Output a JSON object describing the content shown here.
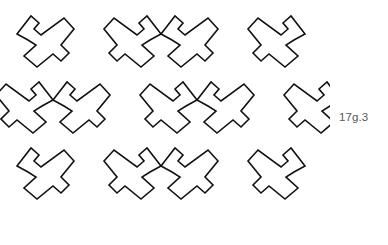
{
  "figure": {
    "label": "17g.3",
    "label_color": "#58595b",
    "background_color": "#ffffff",
    "stroke_color": "#111111",
    "stroke_width": 1.6,
    "width": 388,
    "height": 245
  },
  "chart_data": {
    "type": "diagram",
    "title": "17g.3",
    "subtype": "geometric tessellation / tiling pattern",
    "rows": 3,
    "tiles_per_row": 4,
    "total_tiles": 12,
    "unit_cell": {
      "width": 72,
      "height": 68
    },
    "grid_origin": {
      "x": 17,
      "y": 12
    },
    "row_offsets_x": [
      0,
      36,
      0
    ],
    "row_offsets_y": [
      0,
      66,
      132
    ],
    "crossing_points": [
      {
        "x": 85,
        "y": 57
      },
      {
        "x": 160,
        "y": 57
      },
      {
        "x": 232,
        "y": 57
      },
      {
        "x": 52,
        "y": 122
      },
      {
        "x": 125,
        "y": 122
      },
      {
        "x": 197,
        "y": 122
      },
      {
        "x": 268,
        "y": 122
      },
      {
        "x": 85,
        "y": 188
      },
      {
        "x": 160,
        "y": 188
      },
      {
        "x": 232,
        "y": 188
      }
    ],
    "pattern_bounds": {
      "left": 16,
      "top": 12,
      "right": 306,
      "bottom": 231
    },
    "tile_outline_points": [
      [
        0,
        22
      ],
      [
        14,
        4
      ],
      [
        22,
        11
      ],
      [
        17,
        17
      ],
      [
        24,
        23
      ],
      [
        47,
        6
      ],
      [
        57,
        17
      ],
      [
        44,
        33
      ],
      [
        52,
        41
      ],
      [
        44,
        49
      ],
      [
        36,
        42
      ],
      [
        20,
        55
      ],
      [
        7,
        44
      ],
      [
        19,
        33
      ],
      [
        11,
        28
      ]
    ],
    "grid_on": false,
    "legend": "none",
    "annotations": [
      "17g.3"
    ]
  },
  "tiles": [
    {
      "row": 0,
      "col": 0,
      "x": 17,
      "y": 12,
      "mirror": false
    },
    {
      "row": 0,
      "col": 1,
      "x": 89,
      "y": 12,
      "mirror": true
    },
    {
      "row": 0,
      "col": 2,
      "x": 161,
      "y": 12,
      "mirror": false
    },
    {
      "row": 0,
      "col": 3,
      "x": 233,
      "y": 12,
      "mirror": true
    },
    {
      "row": 1,
      "col": 0,
      "x": -19,
      "y": 78,
      "mirror": true
    },
    {
      "row": 1,
      "col": 1,
      "x": 53,
      "y": 78,
      "mirror": false
    },
    {
      "row": 1,
      "col": 2,
      "x": 125,
      "y": 78,
      "mirror": true
    },
    {
      "row": 1,
      "col": 3,
      "x": 197,
      "y": 78,
      "mirror": false
    },
    {
      "row": 1,
      "col": 4,
      "x": 269,
      "y": 78,
      "mirror": true
    },
    {
      "row": 2,
      "col": 0,
      "x": 17,
      "y": 144,
      "mirror": false
    },
    {
      "row": 2,
      "col": 1,
      "x": 89,
      "y": 144,
      "mirror": true
    },
    {
      "row": 2,
      "col": 2,
      "x": 161,
      "y": 144,
      "mirror": false
    },
    {
      "row": 2,
      "col": 3,
      "x": 233,
      "y": 144,
      "mirror": true
    }
  ]
}
